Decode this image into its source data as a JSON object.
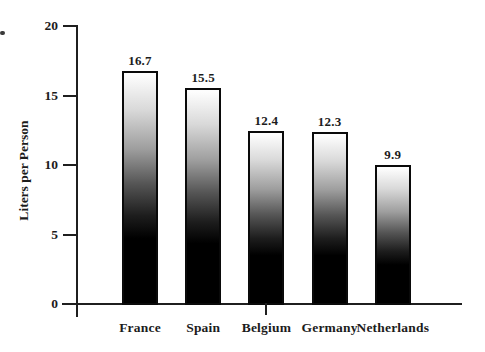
{
  "chart_data": {
    "type": "bar",
    "categories": [
      "France",
      "Spain",
      "Belgium",
      "Germany",
      "Netherlands"
    ],
    "values": [
      16.7,
      15.5,
      12.4,
      12.3,
      9.9
    ],
    "value_labels": [
      "16.7",
      "15.5",
      "12.4",
      "12.3",
      "9.9"
    ],
    "title": "",
    "xlabel": "",
    "ylabel": "Liters per Person",
    "ylim": [
      0,
      20
    ],
    "yticks": [
      0,
      5,
      10,
      15,
      20
    ],
    "ytick_labels": [
      "0",
      "5",
      "10",
      "15",
      "20"
    ],
    "grid": false,
    "legend": "none",
    "x_tick_marks_below_axis": [
      "Belgium"
    ],
    "bar_fill": "vertical gradient, white at top fading to solid black at bottom",
    "bar_border_color": "#0a0a0a",
    "axis_color": "#1f1f1f",
    "text_color": "#1c1c1c",
    "background_color": "#ffffff"
  }
}
